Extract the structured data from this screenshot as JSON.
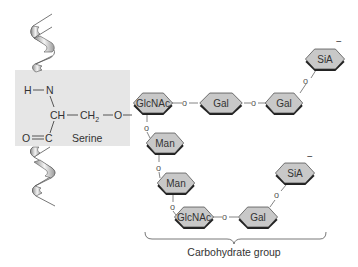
{
  "diagram": {
    "serine_box": {
      "color": "#e6e6e6",
      "atoms": {
        "h_n": "H",
        "n": "N",
        "ch": "CH",
        "ch2": "CH",
        "ch2_sub": "2",
        "o_link": "O",
        "o_double": "O",
        "c": "C"
      },
      "label": "Serine"
    },
    "sugars": [
      {
        "id": "glcnac-1",
        "label": "GlcNAc"
      },
      {
        "id": "gal-1",
        "label": "Gal"
      },
      {
        "id": "gal-2",
        "label": "Gal"
      },
      {
        "id": "sia-1",
        "label": "SiA",
        "charge": "−"
      },
      {
        "id": "man-1",
        "label": "Man"
      },
      {
        "id": "man-2",
        "label": "Man"
      },
      {
        "id": "glcnac-2",
        "label": "GlcNAc"
      },
      {
        "id": "gal-3",
        "label": "Gal"
      },
      {
        "id": "sia-2",
        "label": "SiA",
        "charge": "−"
      }
    ],
    "glycosidic_link": "o",
    "bracket_label": "Carbohydrate group",
    "colors": {
      "sugar_fill": "#c8c8c8",
      "sugar_shadow": "#222222",
      "helix_light": "#f2f2f2",
      "helix_dark": "#9a9a9a"
    }
  }
}
